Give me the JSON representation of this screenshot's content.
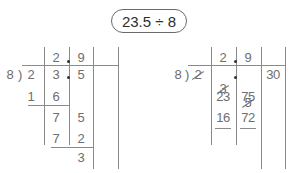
{
  "title": "23.5 ÷ 8",
  "left_method": {
    "divisor": "8",
    "bracket": ")",
    "quotient": [
      "2",
      "9"
    ],
    "dividend": [
      "2",
      "3",
      "5"
    ],
    "steps": [
      {
        "left": "1",
        "right": "6"
      },
      {
        "left": "7",
        "right": "5"
      },
      {
        "left": "7",
        "right": "2"
      }
    ],
    "remainder": "3"
  },
  "right_method": {
    "divisor": "8",
    "bracket": ")",
    "quotient": [
      "2",
      "9"
    ],
    "dividend": [
      "2",
      "3",
      "5"
    ],
    "extra": "30",
    "rows": [
      {
        "left": "23",
        "right": "75"
      },
      {
        "left": "16",
        "right": "72"
      },
      {
        "left": "7",
        "right": "3"
      }
    ]
  },
  "colors": {
    "digits": "#6e6e6e",
    "lines": "#8a8a8a",
    "title_text": "#2e2e2e"
  }
}
